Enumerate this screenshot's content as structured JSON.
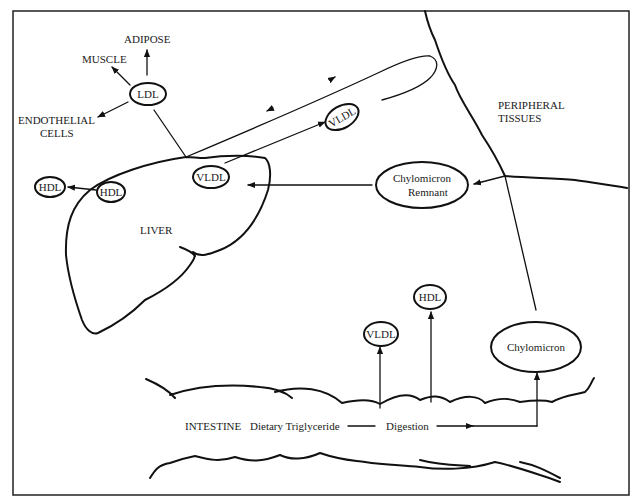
{
  "diagram": {
    "regions": {
      "liver": "LIVER",
      "peripheral": [
        "PERIPHERAL",
        "TISSUES"
      ],
      "intestine": "INTESTINE"
    },
    "targets": {
      "adipose": "ADIPOSE",
      "muscle": "MUSCLE",
      "endothelial": [
        "ENDOTHELIAL",
        "CELLS"
      ]
    },
    "nodes": {
      "ldl": "LDL",
      "hdl_out": "HDL",
      "hdl_liver": "HDL",
      "vldl_liver": "VLDL",
      "vldl_circ": "VLDL",
      "remnant": [
        "Chylomicron",
        "Remnant"
      ],
      "chylomicron": "Chylomicron",
      "vldl_int": "VLDL",
      "hdl_int": "HDL"
    },
    "process": {
      "dietary": "Dietary Triglyceride",
      "digestion": "Digestion"
    },
    "colors": {
      "ink": "#111111",
      "background": "#ffffff"
    }
  }
}
